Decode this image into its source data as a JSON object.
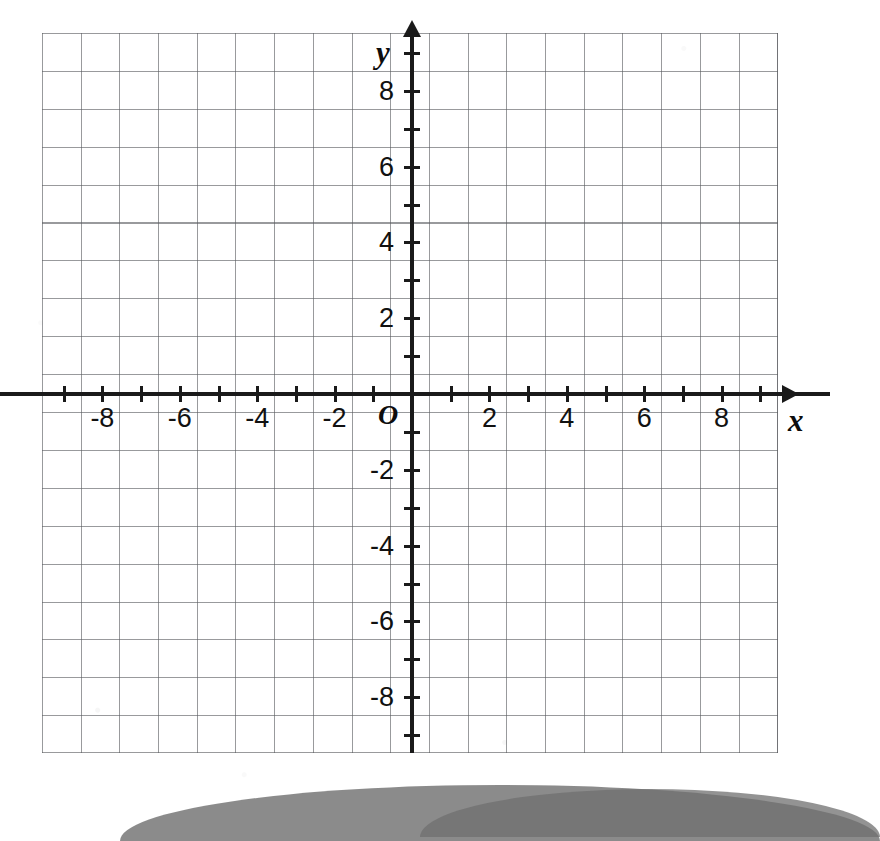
{
  "figure": {
    "kind": "cartesian-coordinate-grid",
    "origin_label": "O",
    "x_axis_label": "x",
    "y_axis_label": "y"
  },
  "chart_data": {
    "type": "scatter",
    "title": "",
    "subtitle": "",
    "xlabel": "x",
    "ylabel": "y",
    "origin_label": "O",
    "xlim": [
      -9.7,
      9.6
    ],
    "ylim": [
      -9.4,
      9.5
    ],
    "grid": true,
    "grid_step": 1,
    "tick_step": 1,
    "label_step": 2,
    "legend": "none",
    "series": [],
    "x_tick_labels": [
      "-8",
      "-6",
      "-4",
      "-2",
      "2",
      "4",
      "6",
      "8"
    ],
    "x_tick_values": [
      -8,
      -6,
      -4,
      -2,
      2,
      4,
      6,
      8
    ],
    "y_tick_labels": [
      "8",
      "6",
      "4",
      "2",
      "-2",
      "-4",
      "-6",
      "-8"
    ],
    "y_tick_values": [
      8,
      6,
      4,
      2,
      -2,
      -4,
      -6,
      -8
    ],
    "all_x_ticks": [
      -9,
      -8,
      -7,
      -6,
      -5,
      -4,
      -3,
      -2,
      -1,
      1,
      2,
      3,
      4,
      5,
      6,
      7,
      8,
      9
    ],
    "all_y_ticks": [
      -9,
      -8,
      -7,
      -6,
      -5,
      -4,
      -3,
      -2,
      -1,
      1,
      2,
      3,
      4,
      5,
      6,
      7,
      8,
      9
    ],
    "annotations": []
  },
  "style": {
    "grid_color": "#5a5c60",
    "axis_color": "#1a1a1a",
    "label_color": "#111111",
    "background": "#ffffff",
    "shadow_color": "#7c7c7c"
  }
}
